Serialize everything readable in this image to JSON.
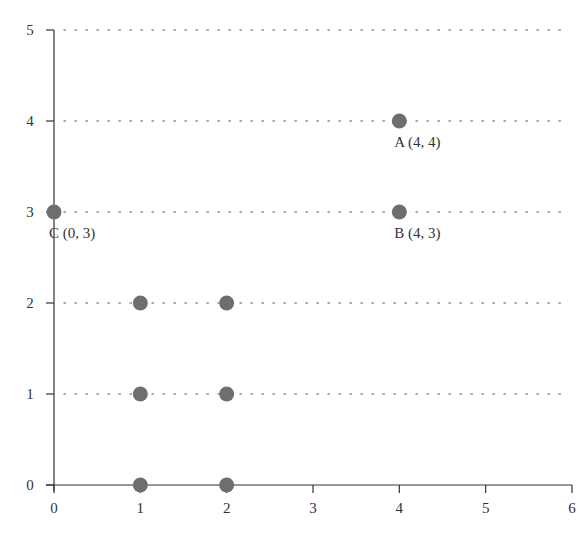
{
  "chart_data": {
    "type": "scatter",
    "title": "",
    "xlabel": "",
    "ylabel": "",
    "xlim": [
      0,
      6
    ],
    "ylim": [
      0,
      5
    ],
    "x_ticks": [
      "0",
      "1",
      "2",
      "3",
      "4",
      "5",
      "6"
    ],
    "y_ticks": [
      "0",
      "1",
      "2",
      "3",
      "4",
      "5"
    ],
    "grid": {
      "horizontal": true,
      "vertical": false,
      "style": "dotted"
    },
    "legend": null,
    "point_color": "#6e6e6e",
    "points": [
      {
        "x": 4,
        "y": 4,
        "label": "A (4, 4)"
      },
      {
        "x": 4,
        "y": 3,
        "label": "B (4, 3)"
      },
      {
        "x": 0,
        "y": 3,
        "label": "C (0, 3)"
      },
      {
        "x": 1,
        "y": 2,
        "label": ""
      },
      {
        "x": 2,
        "y": 2,
        "label": ""
      },
      {
        "x": 1,
        "y": 1,
        "label": ""
      },
      {
        "x": 2,
        "y": 1,
        "label": ""
      },
      {
        "x": 1,
        "y": 0,
        "label": ""
      },
      {
        "x": 2,
        "y": 0,
        "label": ""
      }
    ]
  }
}
